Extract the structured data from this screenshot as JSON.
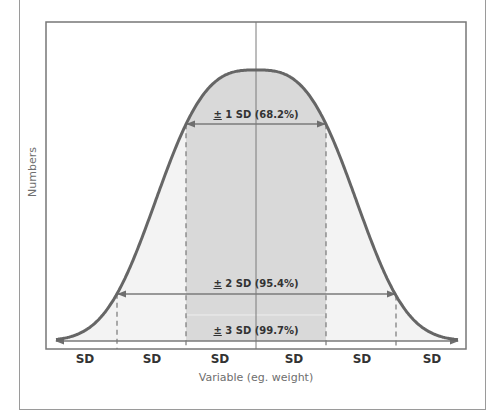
{
  "chart_data": {
    "type": "area",
    "title": "",
    "xlabel": "Variable (eg. weight)",
    "ylabel": "Numbers",
    "x_tick_labels": [
      "SD",
      "SD",
      "SD",
      "SD",
      "SD",
      "SD"
    ],
    "distribution": "normal",
    "mean": 0,
    "sd_markers": [
      -2,
      -1,
      0,
      1,
      2
    ],
    "bands": [
      {
        "label": "1 SD (68.2%)",
        "range_sd": [
          -1,
          1
        ],
        "percent": 68.2
      },
      {
        "label": "2 SD (95.4%)",
        "range_sd": [
          -2,
          2
        ],
        "percent": 95.4
      },
      {
        "label": "3 SD (99.7%)",
        "range_sd": [
          -3,
          3
        ],
        "percent": 99.7
      }
    ],
    "grid": false,
    "legend": "none"
  },
  "labels": {
    "pm": "±",
    "band1": "1 SD (68.2%)",
    "band2": "2 SD (95.4%)",
    "band3": "3 SD (99.7%)",
    "ylabel": "Numbers",
    "xlabel": "Variable (eg. weight)",
    "sd": [
      "SD",
      "SD",
      "SD",
      "SD",
      "SD",
      "SD"
    ]
  },
  "colors": {
    "curve": "#666666",
    "inner_fill": "#d9d9d9",
    "outer_fill": "#f3f3f3",
    "axis": "#777777",
    "arrow": "#7a7a7a"
  },
  "geometry": {
    "mean_px": 256,
    "sd_px": 70,
    "base_y": 341,
    "peak_y": 70,
    "plot": {
      "left": 46,
      "top": 22,
      "right": 466,
      "bottom": 349
    },
    "tail_left_x": 56,
    "tail_right_x": 458,
    "arrow_y": {
      "band1": 124,
      "band2": 294,
      "band3": 341
    }
  }
}
